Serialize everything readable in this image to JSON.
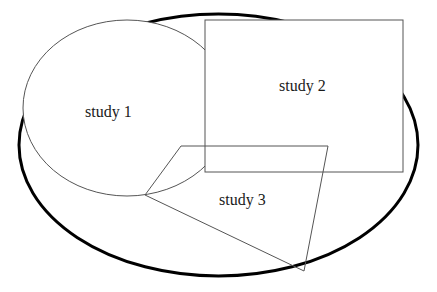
{
  "diagram": {
    "type": "venn-like overlap diagram",
    "universe": {
      "shape": "ellipse",
      "cx": 218.5,
      "cy": 145,
      "rx": 199.5,
      "ry": 131,
      "stroke": "#000000",
      "stroke_width": 3
    },
    "shapes": [
      {
        "id": "study1",
        "label": "study 1",
        "shape": "ellipse",
        "cx": 127,
        "cy": 108,
        "rx": 104,
        "ry": 88,
        "label_x": 85,
        "label_y": 117
      },
      {
        "id": "study2",
        "label": "study 2",
        "shape": "rectangle",
        "x": 205,
        "y": 20,
        "width": 198,
        "height": 152,
        "label_x": 279,
        "label_y": 91
      },
      {
        "id": "study3",
        "label": "study 3",
        "shape": "quadrilateral",
        "points": [
          [
            145,
            195
          ],
          [
            181,
            146
          ],
          [
            328,
            146
          ],
          [
            304,
            271
          ]
        ],
        "label_x": 219,
        "label_y": 205
      }
    ],
    "colors": {
      "background": "#ffffff",
      "outline": "#555555",
      "universe_outline": "#000000",
      "text": "#1a1a1a"
    }
  }
}
